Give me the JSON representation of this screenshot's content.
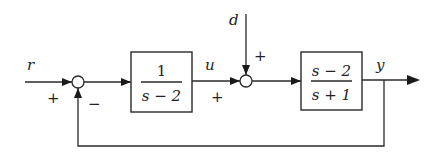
{
  "diagram": {
    "type": "feedback-control-block-diagram",
    "signals": {
      "reference": "r",
      "control": "u",
      "disturbance": "d",
      "output": "y"
    },
    "blocks": [
      {
        "id": "controller",
        "numerator": "1",
        "denominator": "s − 2"
      },
      {
        "id": "plant",
        "numerator": "s − 2",
        "denominator": "s + 1"
      }
    ],
    "summing_junctions": [
      {
        "id": "error-sum",
        "input_sign": "+",
        "feedback_sign": "−"
      },
      {
        "id": "disturbance-sum",
        "u_sign": "+",
        "d_sign": "+"
      }
    ]
  }
}
